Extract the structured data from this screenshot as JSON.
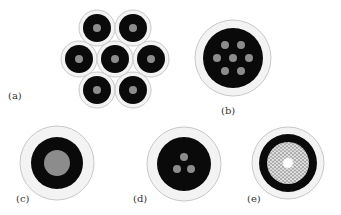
{
  "figure": {
    "panels": [
      {
        "id": "a",
        "label": "(a)",
        "description": "Seven-fiber hexagonal bundle, each with cladding, black coating ring and gray core",
        "fibers": [
          {
            "cx": 97,
            "cy": 28
          },
          {
            "cx": 133,
            "cy": 28
          },
          {
            "cx": 79,
            "cy": 59
          },
          {
            "cx": 115,
            "cy": 59
          },
          {
            "cx": 151,
            "cy": 59
          },
          {
            "cx": 97,
            "cy": 90
          },
          {
            "cx": 133,
            "cy": 90
          }
        ],
        "outer_r": 18,
        "black_r": 14,
        "core_r": 4
      },
      {
        "id": "b",
        "label": "(b)",
        "description": "Multicore fiber with seven cores in hexagonal arrangement",
        "cx": 233,
        "cy": 58,
        "outer_r": 38,
        "black_r": 30,
        "core_r": 4,
        "cores": [
          {
            "dx": -8,
            "dy": -13
          },
          {
            "dx": 8,
            "dy": -13
          },
          {
            "dx": -16,
            "dy": 0
          },
          {
            "dx": 0,
            "dy": 0
          },
          {
            "dx": 16,
            "dy": 0
          },
          {
            "dx": -8,
            "dy": 13
          },
          {
            "dx": 8,
            "dy": 13
          }
        ]
      },
      {
        "id": "c",
        "label": "(c)",
        "description": "Single large-core fiber",
        "cx": 57,
        "cy": 163,
        "outer_r": 37,
        "black_r": 26,
        "core_r": 13
      },
      {
        "id": "d",
        "label": "(d)",
        "description": "Three-core fiber in triangular arrangement",
        "cx": 184,
        "cy": 164,
        "outer_r": 37,
        "black_r": 27,
        "core_r": 4,
        "cores": [
          {
            "dx": 0,
            "dy": -7
          },
          {
            "dx": -7,
            "dy": 5
          },
          {
            "dx": 7,
            "dy": 5
          }
        ]
      },
      {
        "id": "e",
        "label": "(e)",
        "description": "Photonic crystal fiber with honeycomb air-hole lattice and solid core",
        "cx": 288,
        "cy": 163,
        "outer_r": 36,
        "black_r": 29,
        "lattice_r": 21,
        "center_r": 6
      }
    ],
    "colors": {
      "background": "#ffffff",
      "cladding": "#f3f3f3",
      "cladding_edge": "#c8c8c8",
      "coating": "#0a0a0a",
      "core": "#8c8c8c",
      "lattice": "#b0b0b0",
      "label": "#333333"
    }
  }
}
